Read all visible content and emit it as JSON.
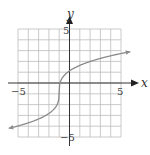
{
  "chart_data": {
    "type": "line",
    "title": "",
    "xlabel": "x",
    "ylabel": "y",
    "xlim": [
      -5,
      5
    ],
    "ylim": [
      -5,
      5
    ],
    "grid": true,
    "grid_step": 1,
    "x_ticks_labeled": [
      "-5",
      "5"
    ],
    "y_ticks_labeled": [
      "5",
      "-5"
    ],
    "series": [
      {
        "name": "curve",
        "shape": "cube-root-like, vertical inflection near x = -1",
        "x": [
          -5.9,
          -5,
          -4,
          -3,
          -2,
          -1.5,
          -1.1,
          -1,
          -0.9,
          -0.5,
          0,
          1,
          2,
          3,
          4,
          5,
          5.9
        ],
        "y": [
          -4.2,
          -3.9,
          -3.6,
          -3.3,
          -2.8,
          -2.4,
          -1.8,
          -0.85,
          0.1,
          0.7,
          1.1,
          1.65,
          2.0,
          2.3,
          2.55,
          2.75,
          2.9
        ],
        "arrows": "both ends"
      }
    ],
    "color": "#8a8a8a"
  },
  "labels": {
    "x_axis": "x",
    "y_axis": "y",
    "x_min": "−5",
    "x_max": "5",
    "y_max": "5",
    "y_min": "−5"
  }
}
